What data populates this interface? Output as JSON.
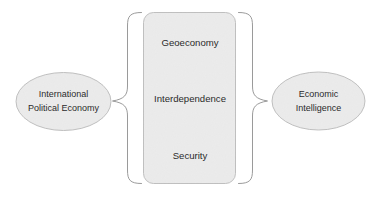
{
  "diagram": {
    "background_color": "#ffffff",
    "shape_fill_color": "#ebebeb",
    "shape_border_color": "#b9b9b9",
    "brace_color": "#8f8f8f",
    "text_color": "#2b2b2b"
  },
  "left_node": {
    "shape": "ellipse",
    "line1": "International",
    "line2": "Political Economy"
  },
  "center_box": {
    "shape": "rounded-rectangle",
    "items": [
      {
        "label": "Geoeconomy"
      },
      {
        "label": "Interdependence"
      },
      {
        "label": "Security"
      }
    ]
  },
  "right_node": {
    "shape": "ellipse",
    "line1": "Economic",
    "line2": "Intelligence"
  },
  "connectors": {
    "left_brace": "left-curly-brace",
    "right_brace": "right-curly-brace"
  }
}
